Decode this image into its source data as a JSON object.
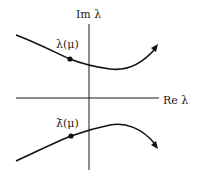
{
  "diagram": {
    "type": "complex-plane-eigenvalue-paths",
    "axes": {
      "imag_label": "Im λ",
      "real_label": "Re λ"
    },
    "curves": [
      {
        "id": "upper",
        "point_label": "λ(μ)",
        "description": "eigenvalue path in upper half-plane, arrow pointing up-right"
      },
      {
        "id": "lower",
        "point_label": "λ̄(μ)",
        "description": "conjugate eigenvalue path in lower half-plane, arrow pointing down-right"
      }
    ],
    "colors": {
      "ink": "#111111",
      "background": "#ffffff"
    }
  }
}
